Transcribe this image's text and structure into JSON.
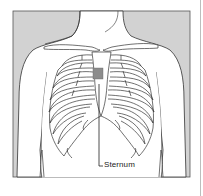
{
  "figure": {
    "label": "Sternum",
    "colors": {
      "background_panel": "#d2d2d2",
      "body_fill": "#ffffff",
      "outline": "#333333",
      "marker": "#8c8c8c"
    },
    "marker": {
      "shape": "square",
      "description": "Placement marker over upper sternum"
    }
  }
}
